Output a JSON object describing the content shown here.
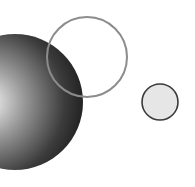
{
  "canvas": {
    "width": 195,
    "height": 187,
    "background": "#ffffff"
  },
  "shapes": {
    "sphere": {
      "cx": 15,
      "cy": 102,
      "r": 68,
      "highlight": "#f2f2f2",
      "mid": "#8a8a8a",
      "edge": "#1e1e1e"
    },
    "outline_circle": {
      "cx": 87,
      "cy": 57,
      "r": 40,
      "stroke": "#8c8c8c",
      "stroke_width": 2
    },
    "small_circle": {
      "cx": 160,
      "cy": 102,
      "r": 18,
      "fill": "#e6e6e6",
      "stroke": "#3a3a3a",
      "stroke_width": 1.6
    }
  }
}
